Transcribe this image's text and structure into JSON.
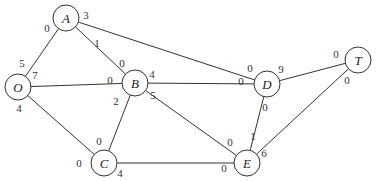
{
  "diagram": {
    "type": "network-flow-graph",
    "nodes": [
      {
        "id": "A",
        "label": "A",
        "x": 66,
        "y": 18
      },
      {
        "id": "O",
        "label": "O",
        "x": 18,
        "y": 87
      },
      {
        "id": "B",
        "label": "B",
        "x": 135,
        "y": 83
      },
      {
        "id": "C",
        "label": "C",
        "x": 104,
        "y": 163
      },
      {
        "id": "D",
        "label": "D",
        "x": 267,
        "y": 84
      },
      {
        "id": "T",
        "label": "T",
        "x": 358,
        "y": 60
      },
      {
        "id": "E",
        "label": "E",
        "x": 247,
        "y": 163
      }
    ],
    "edges": [
      {
        "from": "O",
        "to": "A",
        "from_cap": "5",
        "to_cap": "0"
      },
      {
        "from": "O",
        "to": "B",
        "from_cap": "7",
        "to_cap": "0"
      },
      {
        "from": "O",
        "to": "C",
        "from_cap": "4",
        "to_cap": "0"
      },
      {
        "from": "A",
        "to": "B",
        "from_cap": "1",
        "to_cap": "0"
      },
      {
        "from": "A",
        "to": "D",
        "from_cap": "3",
        "to_cap": "0"
      },
      {
        "from": "B",
        "to": "C",
        "from_cap": "2",
        "to_cap": "0"
      },
      {
        "from": "B",
        "to": "D",
        "from_cap": "4",
        "to_cap": "0"
      },
      {
        "from": "B",
        "to": "E",
        "from_cap": "5",
        "to_cap": "0"
      },
      {
        "from": "C",
        "to": "E",
        "from_cap": "4",
        "to_cap": "0"
      },
      {
        "from": "D",
        "to": "T",
        "from_cap": "9",
        "to_cap": "0"
      },
      {
        "from": "E",
        "to": "D",
        "from_cap": "1",
        "to_cap": "0"
      },
      {
        "from": "E",
        "to": "T",
        "from_cap": "6",
        "to_cap": "0"
      }
    ],
    "capacity_labels": [
      {
        "text": "3",
        "x": 86,
        "y": 19
      },
      {
        "text": "0",
        "x": 47,
        "y": 32
      },
      {
        "text": "5",
        "x": 22,
        "y": 67
      },
      {
        "text": "7",
        "x": 35,
        "y": 79
      },
      {
        "text": "1",
        "x": 97,
        "y": 47
      },
      {
        "text": "0",
        "x": 122,
        "y": 67
      },
      {
        "text": "0",
        "x": 110,
        "y": 84
      },
      {
        "text": "4",
        "x": 152,
        "y": 78
      },
      {
        "text": "4",
        "x": 19,
        "y": 112
      },
      {
        "text": "2",
        "x": 116,
        "y": 105
      },
      {
        "text": "5",
        "x": 153,
        "y": 99
      },
      {
        "text": "0",
        "x": 99,
        "y": 145
      },
      {
        "text": "0",
        "x": 79,
        "y": 167
      },
      {
        "text": "4",
        "x": 120,
        "y": 177
      },
      {
        "text": "0",
        "x": 250,
        "y": 72
      },
      {
        "text": "0",
        "x": 241,
        "y": 85
      },
      {
        "text": "9",
        "x": 281,
        "y": 73
      },
      {
        "text": "0",
        "x": 265,
        "y": 111
      },
      {
        "text": "0",
        "x": 336,
        "y": 58
      },
      {
        "text": "0",
        "x": 347,
        "y": 84
      },
      {
        "text": "0",
        "x": 230,
        "y": 146
      },
      {
        "text": "1",
        "x": 253,
        "y": 140
      },
      {
        "text": "6",
        "x": 264,
        "y": 157
      },
      {
        "text": "0",
        "x": 224,
        "y": 172
      }
    ]
  }
}
